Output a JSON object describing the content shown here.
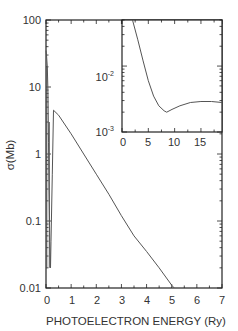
{
  "chart_data": [
    {
      "type": "line",
      "role": "main",
      "title": "",
      "xlabel": "PHOTOELECTRON ENERGY (Ry)",
      "ylabel": "σ(Mb)",
      "xlim": [
        0,
        7
      ],
      "ylim": [
        0.01,
        100
      ],
      "yscale": "log",
      "x_ticks": [
        "0",
        "1",
        "2",
        "3",
        "4",
        "5",
        "6",
        "7"
      ],
      "y_ticks": [
        "0.01",
        "0.1",
        "1",
        "10",
        "100"
      ],
      "grid": false,
      "series": [
        {
          "name": "cross-section",
          "x": [
            0.0,
            0.02,
            0.05,
            0.08,
            0.1,
            0.12,
            0.15,
            0.18,
            0.2,
            0.25,
            0.3,
            0.5,
            1.0,
            1.5,
            2.0,
            2.5,
            3.0,
            3.5,
            4.0,
            4.5,
            5.0,
            5.1
          ],
          "y": [
            35,
            30,
            20,
            8,
            1.5,
            0.3,
            0.05,
            0.02,
            0.05,
            0.5,
            4.5,
            3.8,
            2.0,
            1.0,
            0.5,
            0.25,
            0.12,
            0.06,
            0.035,
            0.02,
            0.011,
            0.01
          ]
        }
      ]
    },
    {
      "type": "line",
      "role": "inset",
      "title": "",
      "xlabel": "",
      "ylabel": "",
      "xlim": [
        0,
        19
      ],
      "ylim": [
        0.001,
        0.05
      ],
      "yscale": "log",
      "x_ticks": [
        "0",
        "5",
        "10",
        "15"
      ],
      "y_ticks": [
        "10^-3",
        "10^-2"
      ],
      "grid": false,
      "series": [
        {
          "name": "cross-section (high energy)",
          "x": [
            2.0,
            3.0,
            4.0,
            5.0,
            6.0,
            7.0,
            8.0,
            8.5,
            9.5,
            11.0,
            13.0,
            15.0,
            17.0,
            19.0
          ],
          "y": [
            0.05,
            0.025,
            0.012,
            0.006,
            0.0035,
            0.0025,
            0.0021,
            0.002,
            0.0022,
            0.0025,
            0.0028,
            0.0029,
            0.0029,
            0.0028
          ]
        }
      ]
    }
  ],
  "labels": {
    "ylabel": "σ(Mb)",
    "xlabel": "PHOTOELECTRON ENERGY (Ry)",
    "main_y_ticks": [
      "100",
      "10",
      "1",
      "0.1",
      "0.01"
    ],
    "main_x_ticks": [
      "0",
      "1",
      "2",
      "3",
      "4",
      "5",
      "6",
      "7"
    ],
    "inset_y_ticks": [
      "10",
      "-2",
      "10",
      "-3"
    ],
    "inset_x_ticks": [
      "0",
      "5",
      "10",
      "15"
    ]
  },
  "colors": {
    "line": "#555555",
    "axis": "#222222",
    "text": "#333333"
  }
}
